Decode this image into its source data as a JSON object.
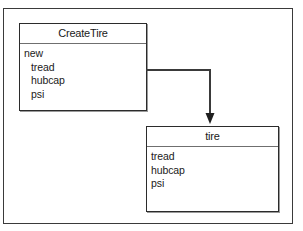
{
  "diagram": {
    "background_color": "#ffffff",
    "frame": {
      "name": "diagram-frame",
      "border_color": "#3a3a3a"
    },
    "classes": [
      {
        "id": "create-tire",
        "name": "CreateTire",
        "members": [
          {
            "label": "new",
            "indented": false
          },
          {
            "label": "tread",
            "indented": true
          },
          {
            "label": "hubcap",
            "indented": true
          },
          {
            "label": "psi",
            "indented": true
          }
        ]
      },
      {
        "id": "tire",
        "name": "tire",
        "members": [
          {
            "label": "tread",
            "indented": false
          },
          {
            "label": "hubcap",
            "indented": false
          },
          {
            "label": "psi",
            "indented": false
          }
        ]
      }
    ],
    "connector": {
      "name": "create-tire-to-tire-arrow",
      "from": "CreateTire",
      "to": "tire",
      "style": "orthogonal",
      "arrowhead": "filled-triangle",
      "line_color": "#3a3a3a"
    }
  }
}
